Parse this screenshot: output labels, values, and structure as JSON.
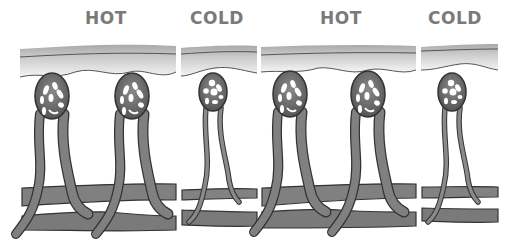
{
  "diagram": {
    "panels": [
      {
        "label": "HOT",
        "capillary_loops": 2,
        "vessel_width": "wide"
      },
      {
        "label": "COLD",
        "capillary_loops": 1,
        "vessel_width": "narrow"
      },
      {
        "label": "HOT",
        "capillary_loops": 2,
        "vessel_width": "wide"
      },
      {
        "label": "COLD",
        "capillary_loops": 1,
        "vessel_width": "narrow"
      }
    ],
    "colors": {
      "label": "#7a7a7a",
      "skin_top": "#b4b4b4",
      "skin_bottom": "#f2f2f2",
      "vessel_fill": "#7d7d7d",
      "vessel_dark": "#5e5e5e",
      "outline": "#333333"
    }
  }
}
